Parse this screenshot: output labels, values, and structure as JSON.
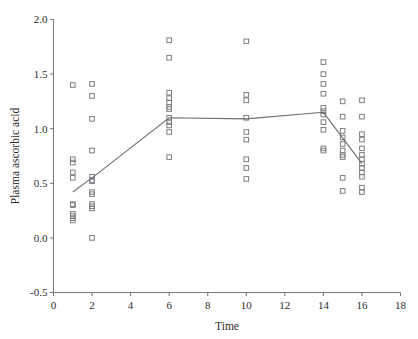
{
  "chart_data": {
    "type": "scatter",
    "title": "",
    "xlabel": "Time",
    "ylabel": "Plasma ascorbic acid",
    "xlim": [
      0,
      18
    ],
    "ylim": [
      -0.5,
      2.0
    ],
    "xticks": [
      0,
      2,
      4,
      6,
      8,
      10,
      12,
      14,
      16,
      18
    ],
    "xtick_labels": [
      "0",
      "2",
      "4",
      "6",
      "8",
      "10",
      "12",
      "14",
      "16",
      "18"
    ],
    "yticks": [
      -0.5,
      0.0,
      0.5,
      1.0,
      1.5,
      2.0
    ],
    "ytick_labels": [
      "-0.5",
      "0.0",
      "0.5",
      "1.0",
      "1.5",
      "2.0"
    ],
    "grid": false,
    "legend": null,
    "marker": "open-square",
    "marker_color": "#7d7d82",
    "line_color": "#6e6e73",
    "points": [
      {
        "x": 1,
        "y": 1.4
      },
      {
        "x": 1,
        "y": 0.72
      },
      {
        "x": 1,
        "y": 0.69
      },
      {
        "x": 1,
        "y": 0.6
      },
      {
        "x": 1,
        "y": 0.55
      },
      {
        "x": 1,
        "y": 0.31
      },
      {
        "x": 1,
        "y": 0.3
      },
      {
        "x": 1,
        "y": 0.22
      },
      {
        "x": 1,
        "y": 0.2
      },
      {
        "x": 1,
        "y": 0.18
      },
      {
        "x": 1,
        "y": 0.16
      },
      {
        "x": 2,
        "y": 1.41
      },
      {
        "x": 2,
        "y": 1.3
      },
      {
        "x": 2,
        "y": 1.09
      },
      {
        "x": 2,
        "y": 0.8
      },
      {
        "x": 2,
        "y": 0.56
      },
      {
        "x": 2,
        "y": 0.53
      },
      {
        "x": 2,
        "y": 0.52
      },
      {
        "x": 2,
        "y": 0.42
      },
      {
        "x": 2,
        "y": 0.4
      },
      {
        "x": 2,
        "y": 0.31
      },
      {
        "x": 2,
        "y": 0.29
      },
      {
        "x": 2,
        "y": 0.27
      },
      {
        "x": 2,
        "y": 0.0
      },
      {
        "x": 6,
        "y": 1.81
      },
      {
        "x": 6,
        "y": 1.65
      },
      {
        "x": 6,
        "y": 1.33
      },
      {
        "x": 6,
        "y": 1.28
      },
      {
        "x": 6,
        "y": 1.24
      },
      {
        "x": 6,
        "y": 1.2
      },
      {
        "x": 6,
        "y": 1.18
      },
      {
        "x": 6,
        "y": 1.1
      },
      {
        "x": 6,
        "y": 1.06
      },
      {
        "x": 6,
        "y": 1.03
      },
      {
        "x": 6,
        "y": 0.97
      },
      {
        "x": 6,
        "y": 0.74
      },
      {
        "x": 10,
        "y": 1.8
      },
      {
        "x": 10,
        "y": 1.31
      },
      {
        "x": 10,
        "y": 1.26
      },
      {
        "x": 10,
        "y": 1.1
      },
      {
        "x": 10,
        "y": 0.97
      },
      {
        "x": 10,
        "y": 0.9
      },
      {
        "x": 10,
        "y": 0.72
      },
      {
        "x": 10,
        "y": 0.64
      },
      {
        "x": 10,
        "y": 0.54
      },
      {
        "x": 14,
        "y": 1.61
      },
      {
        "x": 14,
        "y": 1.5
      },
      {
        "x": 14,
        "y": 1.41
      },
      {
        "x": 14,
        "y": 1.32
      },
      {
        "x": 14,
        "y": 1.19
      },
      {
        "x": 14,
        "y": 1.16
      },
      {
        "x": 14,
        "y": 1.13
      },
      {
        "x": 14,
        "y": 1.06
      },
      {
        "x": 14,
        "y": 0.99
      },
      {
        "x": 14,
        "y": 0.82
      },
      {
        "x": 14,
        "y": 0.8
      },
      {
        "x": 15,
        "y": 1.25
      },
      {
        "x": 15,
        "y": 1.11
      },
      {
        "x": 15,
        "y": 0.98
      },
      {
        "x": 15,
        "y": 0.92
      },
      {
        "x": 15,
        "y": 0.86
      },
      {
        "x": 15,
        "y": 0.8
      },
      {
        "x": 15,
        "y": 0.76
      },
      {
        "x": 15,
        "y": 0.74
      },
      {
        "x": 15,
        "y": 0.55
      },
      {
        "x": 15,
        "y": 0.43
      },
      {
        "x": 16,
        "y": 1.26
      },
      {
        "x": 16,
        "y": 1.11
      },
      {
        "x": 16,
        "y": 0.95
      },
      {
        "x": 16,
        "y": 0.9
      },
      {
        "x": 16,
        "y": 0.82
      },
      {
        "x": 16,
        "y": 0.76
      },
      {
        "x": 16,
        "y": 0.72
      },
      {
        "x": 16,
        "y": 0.68
      },
      {
        "x": 16,
        "y": 0.64
      },
      {
        "x": 16,
        "y": 0.6
      },
      {
        "x": 16,
        "y": 0.56
      },
      {
        "x": 16,
        "y": 0.46
      },
      {
        "x": 16,
        "y": 0.42
      }
    ],
    "mean_line": [
      {
        "x": 1,
        "y": 0.42
      },
      {
        "x": 2,
        "y": 0.55
      },
      {
        "x": 6,
        "y": 1.1
      },
      {
        "x": 10,
        "y": 1.09
      },
      {
        "x": 14,
        "y": 1.15
      },
      {
        "x": 16,
        "y": 0.68
      }
    ]
  }
}
